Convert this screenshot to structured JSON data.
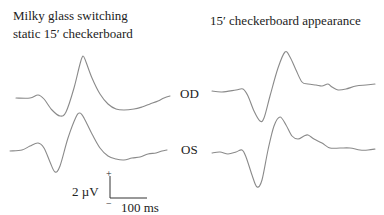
{
  "chart_data": {
    "type": "line",
    "panels": [
      {
        "title_lines": [
          "Milky glass switching",
          "static 15′ checkerboard"
        ],
        "series": [
          {
            "name": "OD",
            "points": [
              [
                16,
                98
              ],
              [
                30,
                98
              ],
              [
                38,
                95
              ],
              [
                44,
                99
              ],
              [
                52,
                110
              ],
              [
                60,
                116
              ],
              [
                66,
                112
              ],
              [
                74,
                88
              ],
              [
                80,
                64
              ],
              [
                83,
                56
              ],
              [
                86,
                62
              ],
              [
                92,
                78
              ],
              [
                100,
                94
              ],
              [
                108,
                104
              ],
              [
                116,
                109
              ],
              [
                124,
                110
              ],
              [
                134,
                109
              ],
              [
                142,
                107
              ],
              [
                150,
                104
              ],
              [
                158,
                101
              ],
              [
                164,
                98
              ],
              [
                170,
                96
              ]
            ]
          },
          {
            "name": "OS",
            "points": [
              [
                10,
                151
              ],
              [
                22,
                150
              ],
              [
                30,
                146
              ],
              [
                38,
                143
              ],
              [
                44,
                148
              ],
              [
                50,
                162
              ],
              [
                55,
                172
              ],
              [
                60,
                166
              ],
              [
                68,
                138
              ],
              [
                76,
                117
              ],
              [
                80,
                113
              ],
              [
                84,
                118
              ],
              [
                92,
                134
              ],
              [
                100,
                148
              ],
              [
                108,
                156
              ],
              [
                116,
                159
              ],
              [
                124,
                160
              ],
              [
                132,
                158
              ],
              [
                140,
                157
              ],
              [
                148,
                154
              ],
              [
                156,
                153
              ],
              [
                162,
                151
              ],
              [
                167,
                150
              ]
            ]
          }
        ]
      },
      {
        "title_lines": [
          "15′ checkerboard appearance"
        ],
        "series": [
          {
            "name": "OD",
            "points": [
              [
                212,
                91
              ],
              [
                222,
                92
              ],
              [
                236,
                90
              ],
              [
                243,
                89
              ],
              [
                248,
                96
              ],
              [
                254,
                111
              ],
              [
                260,
                121
              ],
              [
                264,
                118
              ],
              [
                270,
                96
              ],
              [
                278,
                68
              ],
              [
                285,
                52
              ],
              [
                290,
                57
              ],
              [
                296,
                70
              ],
              [
                302,
                82
              ],
              [
                308,
                84
              ],
              [
                316,
                85
              ],
              [
                322,
                86
              ],
              [
                328,
                84
              ],
              [
                332,
                87
              ],
              [
                338,
                90
              ],
              [
                346,
                89
              ],
              [
                356,
                86
              ],
              [
                366,
                85
              ],
              [
                375,
                84
              ]
            ]
          },
          {
            "name": "OS",
            "points": [
              [
                212,
                153
              ],
              [
                220,
                152
              ],
              [
                228,
                154
              ],
              [
                236,
                152
              ],
              [
                242,
                150
              ],
              [
                246,
                157
              ],
              [
                252,
                175
              ],
              [
                257,
                187
              ],
              [
                262,
                180
              ],
              [
                268,
                150
              ],
              [
                274,
                126
              ],
              [
                280,
                117
              ],
              [
                286,
                125
              ],
              [
                292,
                136
              ],
              [
                298,
                139
              ],
              [
                304,
                136
              ],
              [
                308,
                135
              ],
              [
                314,
                139
              ],
              [
                322,
                143
              ],
              [
                330,
                148
              ],
              [
                340,
                148
              ],
              [
                350,
                148
              ],
              [
                360,
                150
              ],
              [
                368,
                150
              ],
              [
                375,
                149
              ]
            ]
          }
        ]
      }
    ],
    "trace_labels": [
      "OD",
      "OS"
    ],
    "scale_bar": {
      "amplitude": "2 µV",
      "time": "100 ms",
      "plus": "+",
      "minus": "−"
    },
    "xlabel": "",
    "ylabel": "",
    "grid": false,
    "legend": "none"
  },
  "labels": {
    "left_title_1": "Milky glass switching",
    "left_title_2": "static 15′ checkerboard",
    "right_title": "15′ checkerboard appearance",
    "od": "OD",
    "os": "OS",
    "amp": "2 µV",
    "time": "100 ms",
    "plus": "+",
    "minus": "−"
  },
  "colors": {
    "trace": "#8a8a8a",
    "text": "#222222"
  }
}
